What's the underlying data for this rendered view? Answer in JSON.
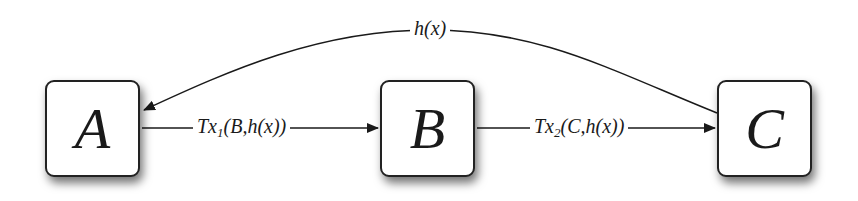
{
  "diagram": {
    "nodes": [
      {
        "id": "A",
        "label": "A"
      },
      {
        "id": "B",
        "label": "B"
      },
      {
        "id": "C",
        "label": "C"
      }
    ],
    "edges": [
      {
        "from": "A",
        "to": "B",
        "label_main": "Tx",
        "label_sub": "1",
        "label_args": "(B,h(x))"
      },
      {
        "from": "B",
        "to": "C",
        "label_main": "Tx",
        "label_sub": "2",
        "label_args": "(C,h(x))"
      },
      {
        "from": "C",
        "to": "A",
        "label": "h(x)"
      }
    ]
  }
}
